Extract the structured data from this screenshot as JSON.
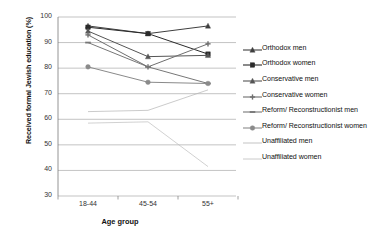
{
  "chart_data": {
    "type": "line",
    "title": "",
    "xlabel": "Age group",
    "ylabel": "Received formal Jewish education (%)",
    "categories": [
      "18-44",
      "45-54",
      "55+"
    ],
    "ylim": [
      30,
      100
    ],
    "yticks": [
      30,
      40,
      50,
      60,
      70,
      80,
      90,
      100
    ],
    "grid": "horizontal",
    "legend_position": "right",
    "series": [
      {
        "name": "Orthodox men",
        "values": [
          96.5,
          93.5,
          96.5
        ],
        "color": "#3f3f3f",
        "marker": "triangle"
      },
      {
        "name": "Orthodox women",
        "values": [
          96.0,
          93.5,
          85.5
        ],
        "color": "#2b2b2b",
        "marker": "square"
      },
      {
        "name": "Conservative men",
        "values": [
          94.5,
          84.5,
          85.0
        ],
        "color": "#555555",
        "marker": "triangle"
      },
      {
        "name": "Conservative women",
        "values": [
          93.0,
          80.5,
          89.5
        ],
        "color": "#6e6e6e",
        "marker": "cross"
      },
      {
        "name": "Reform/ Reconstructionist men",
        "values": [
          90.0,
          80.5,
          74.0
        ],
        "color": "#777777",
        "marker": "dash"
      },
      {
        "name": "Reform/ Reconstructionist women",
        "values": [
          80.5,
          74.5,
          74.0
        ],
        "color": "#8a8a8a",
        "marker": "circle"
      },
      {
        "name": "Unaffiliated men",
        "values": [
          63.0,
          63.5,
          71.5
        ],
        "color": "#b4b4b4",
        "marker": "none"
      },
      {
        "name": "Unaffiliated women",
        "values": [
          58.5,
          59.0,
          41.5
        ],
        "color": "#bdbdbd",
        "marker": "none"
      }
    ]
  }
}
